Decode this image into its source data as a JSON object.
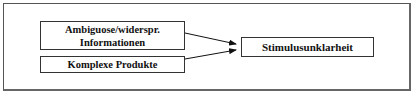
{
  "diagram": {
    "sources": [
      {
        "line1": "Ambiguose/widerspr.",
        "line2": "Informationen"
      },
      {
        "label": "Komplexe Produkte"
      }
    ],
    "target": {
      "label": "Stimulusunklarheit"
    },
    "edges": [
      {
        "from": "Ambiguose/widerspr. Informationen",
        "to": "Stimulusunklarheit"
      },
      {
        "from": "Komplexe Produkte",
        "to": "Stimulusunklarheit"
      }
    ]
  }
}
